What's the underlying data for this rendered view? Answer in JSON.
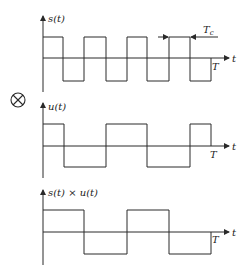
{
  "diagram": {
    "operator_symbol": "⊗",
    "plots": [
      {
        "id": "s",
        "ylabel": "s(t)",
        "xlabel": "t",
        "period_label": "T",
        "annotation": {
          "label": "T",
          "subscript": "c",
          "description": "chip period arrows"
        },
        "levels": {
          "high": 37,
          "zero": 58,
          "low": 81
        },
        "axis": {
          "top": 18,
          "bottom": 92
        },
        "transitions": [
          43,
          63,
          84,
          106,
          127,
          147,
          169,
          190,
          211
        ],
        "start_level": "high"
      },
      {
        "id": "u",
        "ylabel": "u(t)",
        "xlabel": "t",
        "period_label": "T",
        "levels": {
          "high": 124,
          "zero": 146,
          "low": 167
        },
        "axis": {
          "top": 105,
          "bottom": 178
        },
        "transitions": [
          43,
          64,
          106,
          147,
          190,
          211
        ],
        "start_level": "high"
      },
      {
        "id": "product",
        "ylabel": "s(t) × u(t)",
        "xlabel": "t",
        "period_label": "T",
        "levels": {
          "high": 210,
          "zero": 232,
          "low": 254
        },
        "axis": {
          "top": 192,
          "bottom": 265
        },
        "transitions": [
          43,
          84,
          127,
          169,
          211
        ],
        "start_level": "high"
      }
    ]
  }
}
